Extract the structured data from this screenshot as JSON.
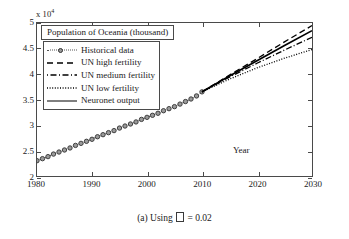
{
  "figure": {
    "caption_prefix": "(a) Using",
    "caption_suffix": "= 0.02",
    "caption_symbol": "missing-glyph-box"
  },
  "chart_data": {
    "type": "line",
    "title": "Population of Oceania (thousand)",
    "xlabel": "Year",
    "ylabel": "",
    "y_multiplier_text": "x 10",
    "y_multiplier_exponent": "4",
    "xlim": [
      1980,
      2030
    ],
    "ylim": [
      2,
      5
    ],
    "grid": false,
    "legend_position": "upper-left",
    "xticks": [
      "1980",
      "1990",
      "2000",
      "2010",
      "2020",
      "2030"
    ],
    "yticks": [
      "2",
      "2.5",
      "3",
      "3.5",
      "4",
      "4.5",
      "5"
    ],
    "series": [
      {
        "name": "Historical data",
        "style": "dotted-with-circle-markers",
        "color": "#555555",
        "x": [
          1980,
          1981,
          1982,
          1983,
          1984,
          1985,
          1986,
          1987,
          1988,
          1989,
          1990,
          1991,
          1992,
          1993,
          1994,
          1995,
          1996,
          1997,
          1998,
          1999,
          2000,
          2001,
          2002,
          2003,
          2004,
          2005,
          2006,
          2007,
          2008,
          2009,
          2010
        ],
        "values": [
          2.3,
          2.34,
          2.38,
          2.43,
          2.47,
          2.51,
          2.55,
          2.6,
          2.64,
          2.68,
          2.72,
          2.77,
          2.81,
          2.85,
          2.89,
          2.94,
          2.98,
          3.02,
          3.06,
          3.11,
          3.15,
          3.19,
          3.23,
          3.28,
          3.32,
          3.36,
          3.41,
          3.46,
          3.51,
          3.57,
          3.65
        ]
      },
      {
        "name": "UN high fertility",
        "style": "dashed",
        "color": "#000000",
        "x": [
          2010,
          2015,
          2020,
          2025,
          2030
        ],
        "values": [
          3.65,
          3.98,
          4.3,
          4.63,
          4.95
        ]
      },
      {
        "name": "UN medium fertility",
        "style": "dash-dot",
        "color": "#000000",
        "x": [
          2010,
          2015,
          2020,
          2025,
          2030
        ],
        "values": [
          3.65,
          3.94,
          4.21,
          4.47,
          4.72
        ]
      },
      {
        "name": "UN low fertility",
        "style": "dotted",
        "color": "#000000",
        "x": [
          2010,
          2015,
          2020,
          2025,
          2030
        ],
        "values": [
          3.65,
          3.9,
          4.12,
          4.31,
          4.48
        ]
      },
      {
        "name": "Neuronet output",
        "style": "solid",
        "color": "#000000",
        "x": [
          2010,
          2015,
          2020,
          2025,
          2030
        ],
        "values": [
          3.65,
          3.96,
          4.26,
          4.56,
          4.85
        ]
      }
    ]
  }
}
